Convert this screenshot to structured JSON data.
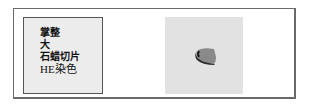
{
  "label": {
    "lines": [
      "掌整",
      "大",
      "石蜡切片",
      "HE染色"
    ]
  },
  "photo": {
    "subject": "tissue specimen (paraffin block)"
  },
  "colors": {
    "frame": "#6a6a6a",
    "label_bg": "#ececec",
    "photo_bg": "#e2e2e2",
    "specimen_dark": "#2a2a2a",
    "specimen_light": "#8a8a8a"
  }
}
